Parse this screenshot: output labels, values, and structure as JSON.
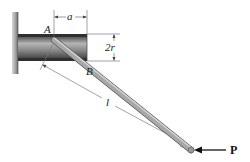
{
  "diagram": {
    "type": "mechanics-figure",
    "labels": {
      "point_a": "A",
      "point_b": "B",
      "dim_a": "a",
      "dim_2r": "2r",
      "dim_l": "l",
      "force": "P"
    },
    "colors": {
      "wall": "#9a9a9a",
      "tube_body": "#8c8c8c",
      "tube_edge": "#3a3a3a",
      "rod": "#9e9e9e",
      "rod_edge": "#555555",
      "dimension_line": "#555555",
      "arrow": "#111111"
    }
  }
}
